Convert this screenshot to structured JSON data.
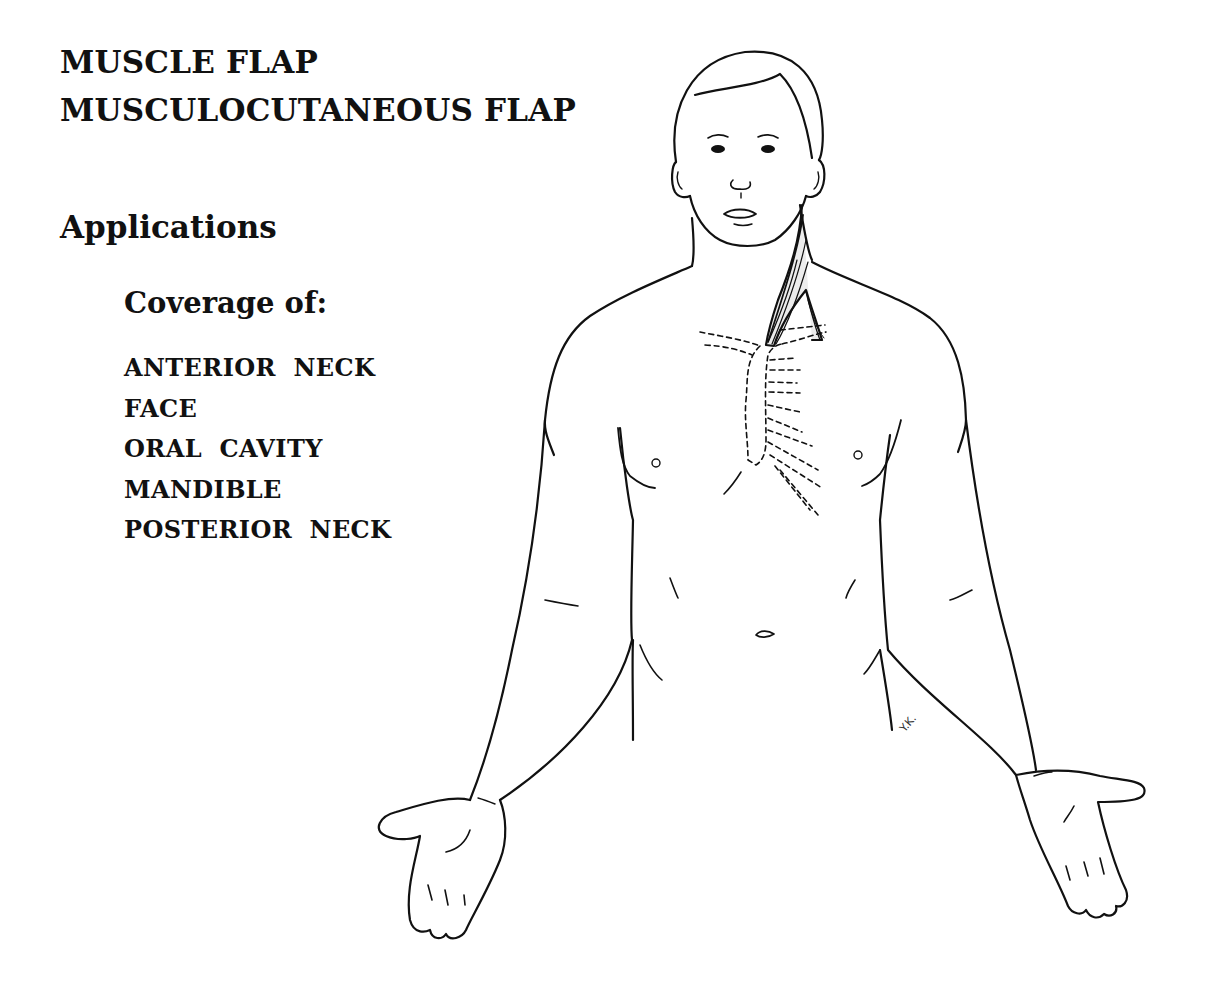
{
  "heading": {
    "line1": "MUSCLE FLAP",
    "line2": "MUSCULOCUTANEOUS FLAP"
  },
  "section_title": "Applications",
  "coverage": {
    "label": "Coverage of:",
    "items": [
      "ANTERIOR  NECK",
      "FACE",
      "ORAL  CAVITY",
      "MANDIBLE",
      "POSTERIOR  NECK"
    ]
  },
  "illustration": {
    "subject": "anterior-body-outline-with-sternocleidomastoid-muscle-flap",
    "signature": "Y.K."
  }
}
